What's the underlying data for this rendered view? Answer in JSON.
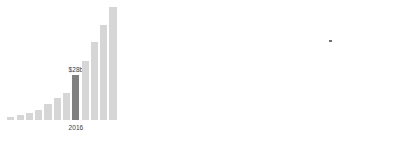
{
  "chart_data": {
    "type": "bar",
    "title": "",
    "subtitle": "",
    "xlabel": "",
    "ylabel": "",
    "grid": false,
    "legend": null,
    "categories": [
      "",
      "",
      "",
      "",
      "",
      "",
      "",
      "2016",
      "",
      "",
      "",
      ""
    ],
    "values": [
      1,
      2,
      3.5,
      5,
      8.5,
      13,
      16,
      28,
      38,
      52,
      69,
      86
    ],
    "ylim": [
      0,
      90
    ],
    "value_unit": "b",
    "annotations": [
      {
        "index": 7,
        "value_label": "$28b",
        "category_label": "2016",
        "highlighted": true
      }
    ],
    "series": [
      {
        "name": "",
        "values": [
          1,
          2,
          3.5,
          5,
          8.5,
          13,
          16,
          28,
          38,
          52,
          69,
          86
        ]
      }
    ],
    "colors": {
      "bar": "#d6d6d6",
      "bar_highlight": "#808080",
      "label_text": "#3a3a3a",
      "background": "#ffffff"
    },
    "bars": [
      {
        "name": "bar-1",
        "x": 27,
        "width": 26,
        "height": 4,
        "highlight": false
      },
      {
        "name": "bar-2",
        "x": 61,
        "width": 26,
        "height": 6,
        "highlight": false
      },
      {
        "name": "bar-3",
        "x": 95,
        "width": 26,
        "height": 9,
        "highlight": false
      },
      {
        "name": "bar-4",
        "x": 129,
        "width": 26,
        "height": 12,
        "highlight": false
      },
      {
        "name": "bar-5",
        "x": 163,
        "width": 26,
        "height": 19,
        "highlight": false
      },
      {
        "name": "bar-6",
        "x": 197,
        "width": 26,
        "height": 27,
        "highlight": false
      },
      {
        "name": "bar-7",
        "x": 231,
        "width": 26,
        "height": 33,
        "highlight": false
      },
      {
        "name": "bar-8",
        "x": 265,
        "width": 26,
        "height": 54,
        "highlight": true
      },
      {
        "name": "bar-9",
        "x": 299,
        "width": 26,
        "height": 71,
        "highlight": false
      },
      {
        "name": "bar-10",
        "x": 333,
        "width": 26,
        "height": 94,
        "highlight": false
      },
      {
        "name": "bar-11",
        "x": 367,
        "width": 26,
        "height": 114,
        "highlight": false
      },
      {
        "name": "bar-12",
        "x": 401,
        "width": 26,
        "height": 136,
        "highlight": false
      }
    ]
  }
}
